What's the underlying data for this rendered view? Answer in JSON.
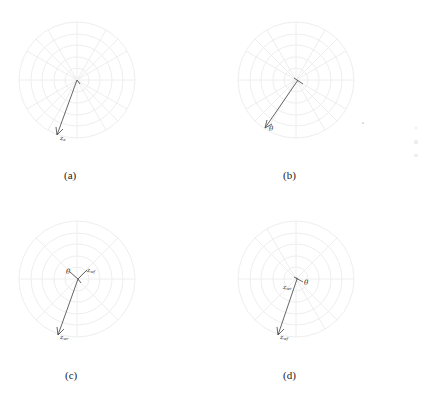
{
  "figure": {
    "grid_color": "#eeeeee",
    "arrow_color": "#555555",
    "panels": [
      {
        "id": "a",
        "caption": "(a)",
        "center": [
          77,
          80
        ],
        "arrows": [
          {
            "from": [
              77,
              80
            ],
            "to": [
              57,
              135
            ],
            "label": "z_e",
            "label_text": "z",
            "label_sub": "e",
            "label_pos": [
              61,
              139
            ]
          }
        ]
      },
      {
        "id": "b",
        "caption": "(b)",
        "center": [
          296,
          80
        ],
        "arrows": [
          {
            "from": [
              298,
              80
            ],
            "to": [
              265,
              128
            ],
            "label": "θ",
            "label_text": "θ",
            "label_sub": "",
            "label_pos": [
              269,
              130
            ]
          }
        ]
      },
      {
        "id": "c",
        "caption": "(c)",
        "center": [
          77,
          279
        ],
        "arrows": [
          {
            "from": [
              78,
              279
            ],
            "to": [
              58,
              335
            ],
            "label": "z_wr",
            "label_text": "z",
            "label_sub": "wr",
            "label_pos": [
              61,
              339
            ]
          },
          {
            "from": [
              78,
              279
            ],
            "to": [
              70,
              271
            ],
            "label": "θ",
            "label_text": "θ",
            "label_sub": "",
            "label_pos": [
              66,
              273
            ]
          },
          {
            "from": [
              78,
              279
            ],
            "to": [
              87,
              270
            ],
            "label": "z_wf",
            "label_text": "z",
            "label_sub": "wf",
            "label_pos": [
              89,
              272
            ]
          }
        ]
      },
      {
        "id": "d",
        "caption": "(d)",
        "center": [
          296,
          279
        ],
        "arrows": [
          {
            "from": [
              297,
              279
            ],
            "to": [
              278,
              335
            ],
            "label": "z_wf",
            "label_text": "z",
            "label_sub": "wf",
            "label_pos": [
              281,
              339
            ]
          },
          {
            "from": [
              297,
              279
            ],
            "to": [
              305,
              282
            ],
            "label": "θ",
            "label_text": "θ",
            "label_sub": "",
            "label_pos": [
              306,
              285
            ]
          },
          {
            "from": [
              297,
              279
            ],
            "label": "z_wr",
            "label_text": "z",
            "label_sub": "wr",
            "label_pos": [
              284,
              290
            ]
          }
        ]
      }
    ]
  },
  "captions": {
    "a": "(a)",
    "b": "(b)",
    "c": "(c)",
    "d": "(d)"
  }
}
